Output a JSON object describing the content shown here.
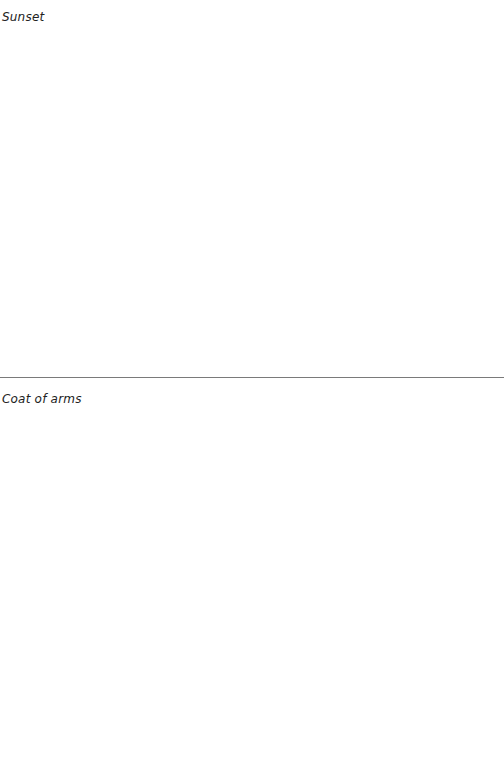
{
  "sections": [
    {
      "label": "Sunset"
    },
    {
      "label": "Coat of arms"
    }
  ],
  "colors": {
    "background": "#ffffff",
    "text": "#222222",
    "divider": "#7a7a7a"
  }
}
